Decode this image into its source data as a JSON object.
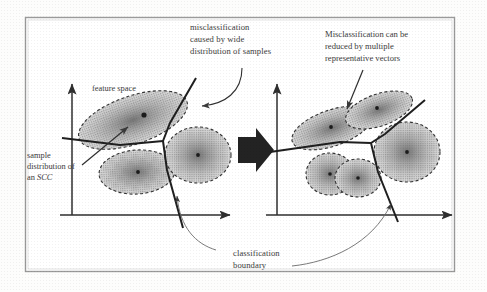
{
  "figure": {
    "title_text": "",
    "frame": {
      "stroke": "#8d8d8d",
      "fill": "#ffffff"
    },
    "colors": {
      "ink": "#2f2f2f",
      "text": "#3b3b3b",
      "cluster_fill_light": "#d8d8d8",
      "cluster_fill_dark": "#8e8e8e",
      "cluster_stroke": "#3a3a3a",
      "center_dot": "#1c1c1c",
      "arrow_thin": "#6b6b6b",
      "transition_arrow": "#232323"
    },
    "captions": {
      "left_top": {
        "lines": [
          "misclassification",
          "caused by wide",
          "distribution of samples"
        ],
        "line1": "misclassification",
        "line2": "caused by wide",
        "line3": "distribution of samples"
      },
      "right_top": {
        "lines": [
          "Misclassification can be",
          "reduced by multiple",
          "representative vectors"
        ],
        "line1": "Misclassification can be",
        "line2": "reduced by multiple",
        "line3": "representative vectors"
      },
      "bottom": {
        "lines": [
          "classification",
          "boundary"
        ],
        "line1": "classification",
        "line2": "boundary"
      },
      "sample_distribution": {
        "lines": [
          "sample",
          "distribution of",
          "an SCC"
        ],
        "line1": "sample",
        "line2": "distribution of",
        "line3_prefix": "an ",
        "line3_italic": "SCC"
      },
      "feature_space": {
        "text": "feature space"
      }
    },
    "panels": [
      {
        "id": "left-panel",
        "name": "before-panel",
        "axes": {
          "origin_x": 72,
          "origin_y": 215,
          "y_top": 82,
          "x_right": 232
        },
        "clusters": [
          {
            "name": "cluster-large-elongated",
            "cx": 133,
            "cy": 120,
            "rx": 57,
            "ry": 24,
            "rotate": -19,
            "dot": true
          },
          {
            "name": "cluster-lower-left",
            "cx": 137,
            "cy": 172,
            "rx": 38,
            "ry": 22,
            "rotate": -4,
            "dot": true
          },
          {
            "name": "cluster-right",
            "cx": 198,
            "cy": 155,
            "rx": 33,
            "ry": 28,
            "rotate": 0,
            "dot": true
          }
        ],
        "boundary_name": "classification-boundary-before"
      },
      {
        "id": "right-panel",
        "name": "after-panel",
        "axes": {
          "origin_x": 277,
          "origin_y": 215,
          "y_top": 82,
          "x_right": 455
        },
        "clusters": [
          {
            "name": "cluster-split-a",
            "cx": 332,
            "cy": 128,
            "rx": 40,
            "ry": 18,
            "rotate": -19,
            "dot": true
          },
          {
            "name": "cluster-split-b",
            "cx": 375,
            "cy": 110,
            "rx": 35,
            "ry": 16,
            "rotate": -19,
            "dot": true
          },
          {
            "name": "cluster-split-c",
            "cx": 330,
            "cy": 174,
            "rx": 24,
            "ry": 21,
            "rotate": 0,
            "dot": true
          },
          {
            "name": "cluster-split-d",
            "cx": 358,
            "cy": 178,
            "rx": 23,
            "ry": 19,
            "rotate": 0,
            "dot": true
          },
          {
            "name": "cluster-right-after",
            "cx": 407,
            "cy": 152,
            "rx": 32,
            "ry": 30,
            "rotate": 0,
            "dot": true
          }
        ],
        "boundary_name": "classification-boundary-after"
      }
    ],
    "transition_arrow": {
      "name": "transition-arrow",
      "direction": "right"
    }
  }
}
